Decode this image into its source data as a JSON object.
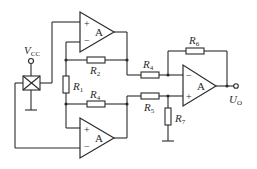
{
  "diagram": {
    "type": "circuit-schematic",
    "supply": {
      "label": "V",
      "sub": "CC"
    },
    "output": {
      "label": "U",
      "sub": "O"
    },
    "amplifiers": [
      {
        "id": "A1",
        "label": "A",
        "plus": "+",
        "minus": "−"
      },
      {
        "id": "A2",
        "label": "A",
        "plus": "+",
        "minus": "−"
      },
      {
        "id": "A3",
        "label": "A",
        "plus": "+",
        "minus": "−"
      }
    ],
    "resistors": [
      {
        "id": "R1",
        "label": "R",
        "sub": "1"
      },
      {
        "id": "R2",
        "label": "R",
        "sub": "2"
      },
      {
        "id": "R4a",
        "label": "R",
        "sub": "4"
      },
      {
        "id": "R4b",
        "label": "R",
        "sub": "4"
      },
      {
        "id": "R5",
        "label": "R",
        "sub": "5"
      },
      {
        "id": "R6",
        "label": "R",
        "sub": "6"
      },
      {
        "id": "R7",
        "label": "R",
        "sub": "7"
      }
    ],
    "colors": {
      "line": "#2b2b2b",
      "background": "#ffffff"
    }
  }
}
